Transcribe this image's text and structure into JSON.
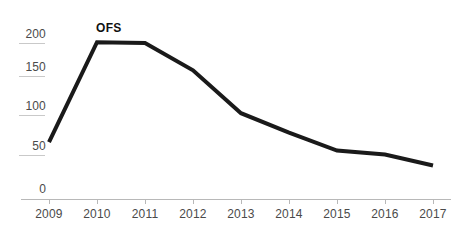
{
  "chart_data": {
    "type": "line",
    "title": "",
    "subtitle": "",
    "xlabel": "",
    "ylabel": "",
    "categories": [
      "2009",
      "2010",
      "2011",
      "2012",
      "2013",
      "2014",
      "2015",
      "2016",
      "2017"
    ],
    "x": [
      2009,
      2010,
      2011,
      2012,
      2013,
      2014,
      2015,
      2016,
      2017
    ],
    "series": [
      {
        "name": "OFS",
        "values": [
          73,
          201,
          200,
          165,
          110,
          85,
          62,
          57,
          43
        ],
        "color": "#1a1a1a"
      }
    ],
    "ylim": [
      0,
      215
    ],
    "xlim": [
      2009,
      2017
    ],
    "y_ticks": [
      0,
      50,
      100,
      150,
      200
    ],
    "y_tick_labels": [
      "0",
      "50",
      "100",
      "150",
      "200"
    ],
    "x_ticks": [
      2009,
      2010,
      2011,
      2012,
      2013,
      2014,
      2015,
      2016,
      2017
    ],
    "x_tick_labels": [
      "2009",
      "2010",
      "2011",
      "2012",
      "2013",
      "2014",
      "2015",
      "2016",
      "2017"
    ],
    "grid": false,
    "legend": "none",
    "annotations": [
      {
        "text": "OFS",
        "x": 2010,
        "y": 201,
        "position": "above-left",
        "bold": true
      }
    ]
  },
  "axis": {
    "y_labels": [
      "200",
      "150",
      "100",
      "50",
      "0"
    ],
    "x_labels": [
      "2009",
      "2010",
      "2011",
      "2012",
      "2013",
      "2014",
      "2015",
      "2016",
      "2017"
    ]
  },
  "style": {
    "line_color": "#1a1a1a",
    "axis_color": "#b8b8b8",
    "tick_text_color": "#4a4a4a",
    "label_color": "#111111",
    "background": "#ffffff",
    "line_width": 4
  },
  "series_label": "OFS"
}
